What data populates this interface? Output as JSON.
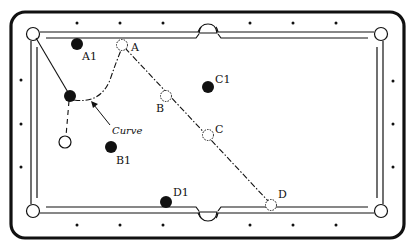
{
  "diagram": {
    "type": "billiards-table-shot-diagram",
    "colors": {
      "ink": "#111111",
      "paper": "#ffffff"
    },
    "labels": {
      "A": "A",
      "B": "B",
      "C": "C",
      "D": "D",
      "A1": "A1",
      "B1": "B1",
      "C1": "C1",
      "D1": "D1",
      "curve": "Curve"
    },
    "balls": [
      {
        "id": "cue-ball",
        "kind": "white",
        "label": ""
      },
      {
        "id": "cue-ball-contact",
        "kind": "black",
        "label": ""
      },
      {
        "id": "A1",
        "kind": "black",
        "label": "A1"
      },
      {
        "id": "B1",
        "kind": "black",
        "label": "B1"
      },
      {
        "id": "C1",
        "kind": "black",
        "label": "C1"
      },
      {
        "id": "D1",
        "kind": "black",
        "label": "D1"
      },
      {
        "id": "A",
        "kind": "ghost",
        "label": "A"
      },
      {
        "id": "B",
        "kind": "ghost",
        "label": "B"
      },
      {
        "id": "C",
        "kind": "ghost",
        "label": "C"
      },
      {
        "id": "D",
        "kind": "ghost",
        "label": "D"
      }
    ],
    "paths": [
      {
        "id": "object-ball-to-pocket",
        "style": "solid",
        "description": "from top-left corner pocket to black contact ball"
      },
      {
        "id": "cue-ball-path",
        "style": "dashed",
        "description": "from white cue ball up to contact ball"
      },
      {
        "id": "curve-path",
        "style": "dash-dot",
        "description": "curving deflection from contact ball up to A"
      },
      {
        "id": "line-A-to-D",
        "style": "dash-dot",
        "description": "straight line A → B → C → D"
      }
    ],
    "annotations": [
      {
        "text": "Curve",
        "arrow": "points to curved path"
      }
    ]
  }
}
